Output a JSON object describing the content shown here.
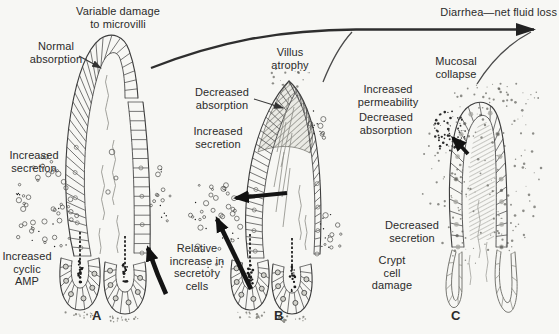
{
  "figure": {
    "flow_label": "Diarrhea—net fluid loss",
    "colors": {
      "background": "#f7f7f4",
      "ink": "#2b2b2b",
      "line": "#3d3d3d"
    },
    "panels": {
      "a": {
        "letter": "A",
        "labels": {
          "variable_damage": "Variable damage\nto microvilli",
          "normal_absorption": "Normal\nabsorption",
          "increased_secretion": "Increased\nsecretion",
          "increased_cyclic_amp": "Increased\ncyclic\nAMP"
        }
      },
      "b": {
        "letter": "B",
        "labels": {
          "villus_atrophy": "Villus\natrophy",
          "decreased_absorption": "Decreased\nabsorption",
          "increased_secretion": "Increased\nsecretion",
          "relative_increase": "Relative\nincrease in\nsecretory\ncells"
        }
      },
      "c": {
        "letter": "C",
        "labels": {
          "mucosal_collapse": "Mucosal\ncollapse",
          "increased_permeability": "Increased\npermeability",
          "decreased_absorption": "Decreased\nabsorption",
          "decreased_secretion": "Decreased\nsecretion",
          "crypt_cell_damage": "Crypt\ncell\ndamage"
        }
      }
    }
  }
}
